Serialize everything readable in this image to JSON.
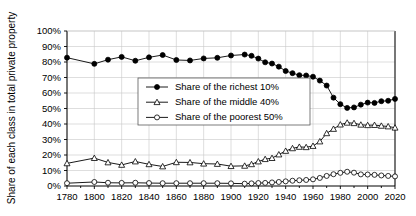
{
  "chart_data": {
    "type": "line",
    "title": "",
    "xlabel": "",
    "ylabel": "Share of each class in total private property",
    "xlim": [
      1780,
      2020
    ],
    "ylim": [
      0,
      100
    ],
    "grid": true,
    "legend_position": "center-left",
    "y_tick_labels": [
      "0%",
      "10%",
      "20%",
      "30%",
      "40%",
      "50%",
      "60%",
      "70%",
      "80%",
      "90%",
      "100%"
    ],
    "y_ticks": [
      0,
      10,
      20,
      30,
      40,
      50,
      60,
      70,
      80,
      90,
      100
    ],
    "x_tick_labels": [
      "1780",
      "1800",
      "1820",
      "1840",
      "1860",
      "1880",
      "1900",
      "1920",
      "1940",
      "1960",
      "1980",
      "2000",
      "2020"
    ],
    "x_ticks": [
      1780,
      1800,
      1820,
      1840,
      1860,
      1880,
      1900,
      1920,
      1940,
      1960,
      1980,
      2000,
      2020
    ],
    "series": [
      {
        "name": "Share of the richest 10%",
        "marker": "filled-circle",
        "x": [
          1780,
          1800,
          1810,
          1820,
          1830,
          1840,
          1850,
          1860,
          1870,
          1880,
          1890,
          1900,
          1910,
          1915,
          1920,
          1925,
          1930,
          1935,
          1940,
          1945,
          1950,
          1955,
          1960,
          1965,
          1970,
          1975,
          1980,
          1985,
          1990,
          1995,
          2000,
          2005,
          2010,
          2015,
          2020
        ],
        "values": [
          82.8,
          78.8,
          81.5,
          83.3,
          80.8,
          83.0,
          84.5,
          81.3,
          81.0,
          82.3,
          82.7,
          84.2,
          84.8,
          84.0,
          82.2,
          79.8,
          79.0,
          77.0,
          74.2,
          72.8,
          71.5,
          71.3,
          70.5,
          68.0,
          64.8,
          57.0,
          52.8,
          50.4,
          50.7,
          52.5,
          53.8,
          53.6,
          54.7,
          55.0,
          56.2
        ]
      },
      {
        "name": "Share of the middle 40%",
        "marker": "open-triangle",
        "x": [
          1780,
          1800,
          1810,
          1820,
          1830,
          1840,
          1850,
          1860,
          1870,
          1880,
          1890,
          1900,
          1910,
          1915,
          1920,
          1925,
          1930,
          1935,
          1940,
          1945,
          1950,
          1955,
          1960,
          1965,
          1970,
          1975,
          1980,
          1985,
          1990,
          1995,
          2000,
          2005,
          2010,
          2015,
          2020
        ],
        "values": [
          14.6,
          18.0,
          15.2,
          13.6,
          15.8,
          14.0,
          12.6,
          15.3,
          15.2,
          14.4,
          14.2,
          12.8,
          13.0,
          14.0,
          15.8,
          17.3,
          18.0,
          20.3,
          22.6,
          24.3,
          25.2,
          25.0,
          25.8,
          28.7,
          34.0,
          36.8,
          39.6,
          40.8,
          40.5,
          39.5,
          39.2,
          39.3,
          38.8,
          38.4,
          37.6
        ]
      },
      {
        "name": "Share of the poorest 50%",
        "marker": "open-circle",
        "x": [
          1780,
          1800,
          1810,
          1820,
          1830,
          1840,
          1850,
          1860,
          1870,
          1880,
          1890,
          1900,
          1910,
          1915,
          1920,
          1925,
          1930,
          1935,
          1940,
          1945,
          1950,
          1955,
          1960,
          1965,
          1970,
          1975,
          1980,
          1985,
          1990,
          1995,
          2000,
          2005,
          2010,
          2015,
          2020
        ],
        "values": [
          1.8,
          2.6,
          2.1,
          2.0,
          2.1,
          1.9,
          1.8,
          1.8,
          1.8,
          1.8,
          1.8,
          1.7,
          1.5,
          1.7,
          1.9,
          2.0,
          2.3,
          2.6,
          3.0,
          3.4,
          3.7,
          3.9,
          4.3,
          5.2,
          6.5,
          7.6,
          8.5,
          9.2,
          8.6,
          7.5,
          7.4,
          7.2,
          6.8,
          6.5,
          6.2
        ]
      }
    ]
  }
}
